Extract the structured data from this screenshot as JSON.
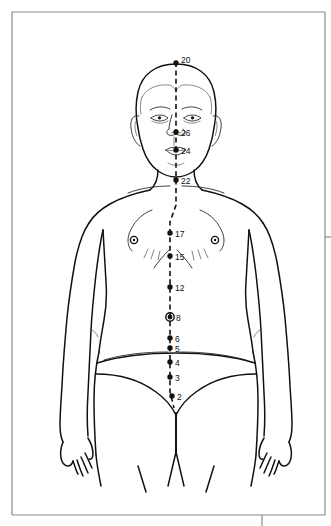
{
  "diagram": {
    "view": "anterior",
    "line_style": "dashed",
    "colors": {
      "outline": "#111111",
      "meridian": "#111111",
      "point": "#111111",
      "border": "#8a8a8a",
      "background": "#ffffff"
    },
    "points": [
      {
        "label": "20",
        "x": 176,
        "y": 63,
        "label_x": 181,
        "label_y": 61,
        "marker": "dot",
        "anchor": "start"
      },
      {
        "label": "26",
        "x": 176,
        "y": 132,
        "label_x": 181,
        "label_y": 134,
        "marker": "dot",
        "anchor": "start"
      },
      {
        "label": "24",
        "x": 176,
        "y": 150,
        "label_x": 181,
        "label_y": 152,
        "marker": "dot",
        "anchor": "start"
      },
      {
        "label": "22",
        "x": 176,
        "y": 180,
        "label_x": 181,
        "label_y": 182,
        "marker": "dot",
        "anchor": "start"
      },
      {
        "label": "17",
        "x": 170,
        "y": 233,
        "label_x": 175,
        "label_y": 235,
        "marker": "dot",
        "anchor": "start"
      },
      {
        "label": "15",
        "x": 170,
        "y": 256,
        "label_x": 175,
        "label_y": 258,
        "marker": "dot",
        "anchor": "start"
      },
      {
        "label": "12",
        "x": 170,
        "y": 287,
        "label_x": 175,
        "label_y": 289,
        "marker": "dot",
        "anchor": "start"
      },
      {
        "label": "8",
        "x": 170,
        "y": 317,
        "label_x": 176,
        "label_y": 319,
        "marker": "ring",
        "anchor": "start"
      },
      {
        "label": "6",
        "x": 170,
        "y": 338,
        "label_x": 175,
        "label_y": 340,
        "marker": "dot",
        "anchor": "start"
      },
      {
        "label": "5",
        "x": 170,
        "y": 348,
        "label_x": 175,
        "label_y": 350,
        "marker": "dot",
        "anchor": "start"
      },
      {
        "label": "4",
        "x": 170,
        "y": 362,
        "label_x": 175,
        "label_y": 364,
        "marker": "dot",
        "anchor": "start"
      },
      {
        "label": "3",
        "x": 170,
        "y": 377,
        "label_x": 175,
        "label_y": 379,
        "marker": "dot",
        "anchor": "start"
      },
      {
        "label": "2",
        "x": 172,
        "y": 396,
        "label_x": 177,
        "label_y": 398,
        "marker": "dot",
        "anchor": "start"
      }
    ],
    "nipples": [
      {
        "name": "left-nipple-marker",
        "x": 134,
        "y": 240,
        "r": 3.2
      },
      {
        "name": "right-nipple-marker",
        "x": 215,
        "y": 240,
        "r": 3.2
      }
    ],
    "frame": {
      "left": 12,
      "top": 12,
      "right": 325,
      "bottom": 515,
      "tick_y": 237,
      "tick_x_bottom": 262
    }
  }
}
